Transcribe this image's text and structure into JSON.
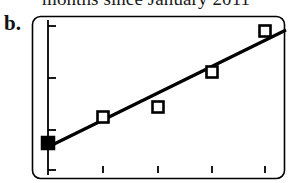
{
  "figure": {
    "panel_label": "b.",
    "cropped_caption": "months since January 2011",
    "background_color": "#ffffff",
    "ink_color": "#000000"
  },
  "chart_data": {
    "type": "scatter",
    "title": "",
    "subtitle": "",
    "xlabel": "months since January 2011",
    "ylabel": "",
    "grid": false,
    "legend_position": "none",
    "frame": {
      "style": "rounded-rectangle",
      "corner_radius_px": 8,
      "left_px": 32,
      "top_px": 16,
      "right_px": 284,
      "bottom_px": 178
    },
    "axes": {
      "y_axis_x_px": 48,
      "y_axis_top_px": 20,
      "y_axis_bottom_px": 175,
      "y_tick_positions_px": [
        26,
        78,
        130,
        170
      ],
      "y_tick_labels": [
        "",
        "",
        "",
        ""
      ],
      "x_tick_positions_px": [
        103,
        158,
        212,
        265
      ],
      "x_tick_labels": [
        "",
        "",
        "",
        ""
      ],
      "xlim": [
        0,
        5
      ],
      "ylim": [
        0,
        5
      ]
    },
    "series": [
      {
        "name": "observations",
        "marker": "square",
        "points": [
          {
            "x_px": 48,
            "y_px": 143,
            "filled": true
          },
          {
            "x_px": 103,
            "y_px": 117,
            "filled": false
          },
          {
            "x_px": 158,
            "y_px": 107,
            "filled": false
          },
          {
            "x_px": 212,
            "y_px": 72,
            "filled": false
          },
          {
            "x_px": 265,
            "y_px": 31,
            "filled": false
          }
        ]
      },
      {
        "name": "fit-line",
        "marker": "none",
        "line": {
          "x1_px": 46,
          "y1_px": 148,
          "x2_px": 286,
          "y2_px": 30
        }
      }
    ]
  }
}
